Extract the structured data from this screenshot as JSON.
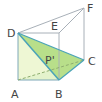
{
  "diagram": {
    "type": "triangular-prism",
    "vertices": {
      "A": {
        "label": "A",
        "x": 18,
        "y": 80
      },
      "B": {
        "label": "B",
        "x": 59,
        "y": 80
      },
      "C": {
        "label": "C",
        "x": 84,
        "y": 60
      },
      "D": {
        "label": "D",
        "x": 18,
        "y": 33
      },
      "E": {
        "label": "E",
        "x": 59,
        "y": 33
      },
      "F": {
        "label": "F",
        "x": 84,
        "y": 8
      }
    },
    "point_label": "P'",
    "colors": {
      "edge": "#a8b0b8",
      "highlight_edge": "#4aa3b8",
      "face_dbc": "#b8df8a",
      "face_dab": "#eef7d4",
      "face_abc": "#e4f3cc",
      "label": "#444444"
    }
  }
}
